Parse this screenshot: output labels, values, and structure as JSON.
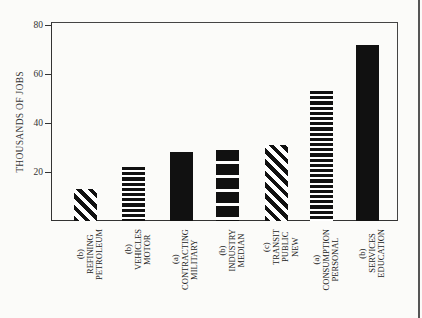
{
  "chart_data": {
    "type": "bar",
    "title": "",
    "xlabel": "",
    "ylabel": "THOUSANDS OF JOBS",
    "ylim": [
      0,
      80
    ],
    "yticks": [
      20,
      40,
      60,
      80
    ],
    "grid": false,
    "legend": null,
    "categories": [
      "PETROLEUM REFINING (b)",
      "MOTOR VEHICLES (b)",
      "MILITARY CONTRACTING (a)",
      "MEDIAN INDUSTRY (b)",
      "NEW PUBLIC TRANSIT (c)",
      "PERSONAL CONSUMPTION (a)",
      "EDUCATION SERVICES (b)"
    ],
    "values": [
      13,
      22,
      28,
      29,
      31,
      53,
      72
    ],
    "patterns": [
      "diagonal",
      "thin-horizontal-stripes",
      "solid",
      "thick-horizontal-stripes",
      "diagonal",
      "thin-horizontal-stripes",
      "solid"
    ]
  },
  "axis": {
    "ylabel": "THOUSANDS OF JOBS",
    "ticks": [
      "20",
      "40",
      "60",
      "80"
    ]
  },
  "bars": [
    {
      "lines": [
        "PETROLEUM",
        "REFINING",
        "(b)"
      ],
      "value": 13
    },
    {
      "lines": [
        "MOTOR",
        "VEHICLES",
        "(b)"
      ],
      "value": 22
    },
    {
      "lines": [
        "MILITARY",
        "CONTRACTING",
        "(a)"
      ],
      "value": 28
    },
    {
      "lines": [
        "MEDIAN",
        "INDUSTRY",
        "(b)"
      ],
      "value": 29
    },
    {
      "lines": [
        "NEW",
        "PUBLIC",
        "TRANSIT",
        "(c)"
      ],
      "value": 31
    },
    {
      "lines": [
        "PERSONAL",
        "CONSUMPTION",
        "(a)"
      ],
      "value": 53
    },
    {
      "lines": [
        "EDUCATION",
        "SERVICES",
        "(b)"
      ],
      "value": 72
    }
  ]
}
